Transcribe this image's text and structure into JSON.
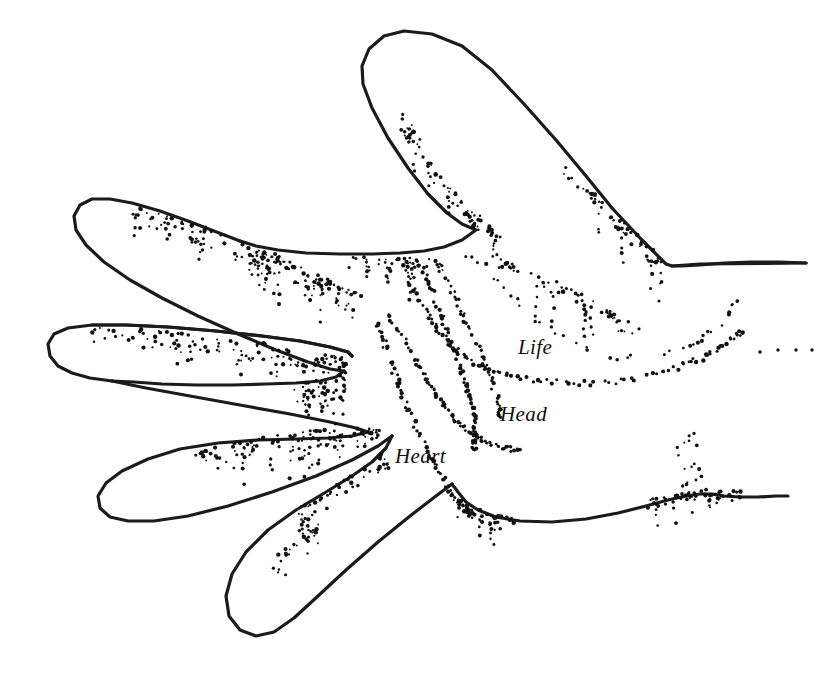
{
  "figure": {
    "background_color": "#ffffff",
    "ink_color": "#1b1b1b",
    "width": 825,
    "height": 681
  },
  "labels": [
    {
      "id": "life",
      "text": "Life",
      "x": 518,
      "y": 335,
      "style": "serif-italic"
    },
    {
      "id": "head",
      "text": "Head",
      "x": 500,
      "y": 402,
      "style": "serif-italic"
    },
    {
      "id": "heart",
      "text": "Heart",
      "x": 395,
      "y": 444,
      "style": "serif-italic"
    }
  ],
  "chart_data": {
    "type": "diagram",
    "annotations": [
      "Life",
      "Head",
      "Heart"
    ],
    "hand_outline": "M 388 42 C 369 40 356 54 357 74 C 358 104 372 146 392 178 C 404 198 420 216 436 228 C 452 240 470 248 486 252 L 530 256 C 560 258 592 262 614 266 L 672 268 L 700 266 L 760 264 L 800 264 L 806 262 L 806 262 L 762 262 L 700 264 L 672 266 L 668 266 L 664 252 L 652 232 L 634 206 L 610 172 L 580 130 L 548 92 L 512 58 L 468 30 L 430 26 L 400 32 Z",
    "outline_points_px": {
      "thumb_tip": [
        380,
        40
      ],
      "index_tip": [
        78,
        206
      ],
      "middle_tip": [
        56,
        356
      ],
      "ring_tip": [
        100,
        482
      ],
      "pinky_tip": [
        240,
        632
      ],
      "upper_right_corner": [
        672,
        266
      ],
      "wrist_top_right": [
        806,
        262
      ],
      "wrist_bottom_right": [
        788,
        497
      ],
      "palm_base": [
        452,
        520
      ]
    },
    "crease_lines": [
      {
        "name": "Life",
        "start": [
          404,
          262
        ],
        "end": [
          742,
          356
        ],
        "style": "stippled-arc"
      },
      {
        "name": "Head",
        "start": [
          388,
          318
        ],
        "end": [
          520,
          448
        ],
        "style": "stippled-curve"
      },
      {
        "name": "Heart",
        "start": [
          376,
          322
        ],
        "end": [
          474,
          516
        ],
        "style": "stippled-curve"
      },
      {
        "name": "Fate",
        "start": [
          418,
          258
        ],
        "end": [
          470,
          446
        ],
        "style": "stippled-curve"
      }
    ],
    "shading": "stippled dots along finger creases and hand edges",
    "grid": false,
    "legend": "none"
  }
}
